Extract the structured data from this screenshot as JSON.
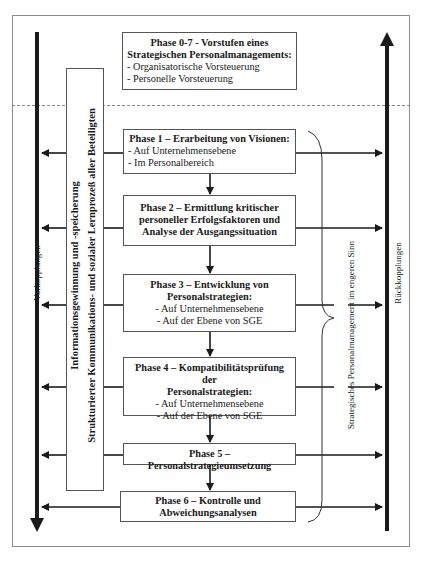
{
  "phase0": {
    "title_line1": "Phase 0-7 - Vorstufen eines",
    "title_line2": "Strategischen Personalmanagements:",
    "items": [
      "- Organisatorische Vorsteuerung",
      "- Personelle Vorsteuerung"
    ]
  },
  "phase1": {
    "title": "Phase 1 – Erarbeitung von Visionen:",
    "items": [
      "- Auf Unternehmensebene",
      "- Im Personalbereich"
    ]
  },
  "phase2": {
    "title_line1": "Phase 2 – Ermittlung kritischer",
    "title_line2": "personeller Erfolgsfaktoren und",
    "title_line3": "Analyse der Ausgangssituation"
  },
  "phase3": {
    "title_line1": "Phase 3 – Entwicklung von",
    "title_line2": "Personalstrategien:",
    "items": [
      "- Auf Unternehmensebene",
      "- Auf der Ebene von SGE"
    ]
  },
  "phase4": {
    "title_line1": "Phase 4 – Kompatibilitätsprüfung der",
    "title_line2": "Personalstrategien:",
    "items": [
      "- Auf Unternehmensebene",
      "- Auf der Ebene von SGE"
    ]
  },
  "phase5": {
    "title": "Phase 5 – Personalstrategieumsetzung"
  },
  "phase6": {
    "title_line1": "Phase 6 – Kontrolle und",
    "title_line2": "Abweichungsanalysen"
  },
  "side_labels": {
    "left_axis": "Vorkopplungen",
    "right_axis": "Rückkopplungen",
    "info_line1": "Informationsgewinnung und -speicherung",
    "info_line2": "Strukturierter Kommunikations- und sozialer Lernprozeß aller Beteiligten",
    "bracket_label": "Strategisches Personalmanagement im engeren Sinn"
  }
}
